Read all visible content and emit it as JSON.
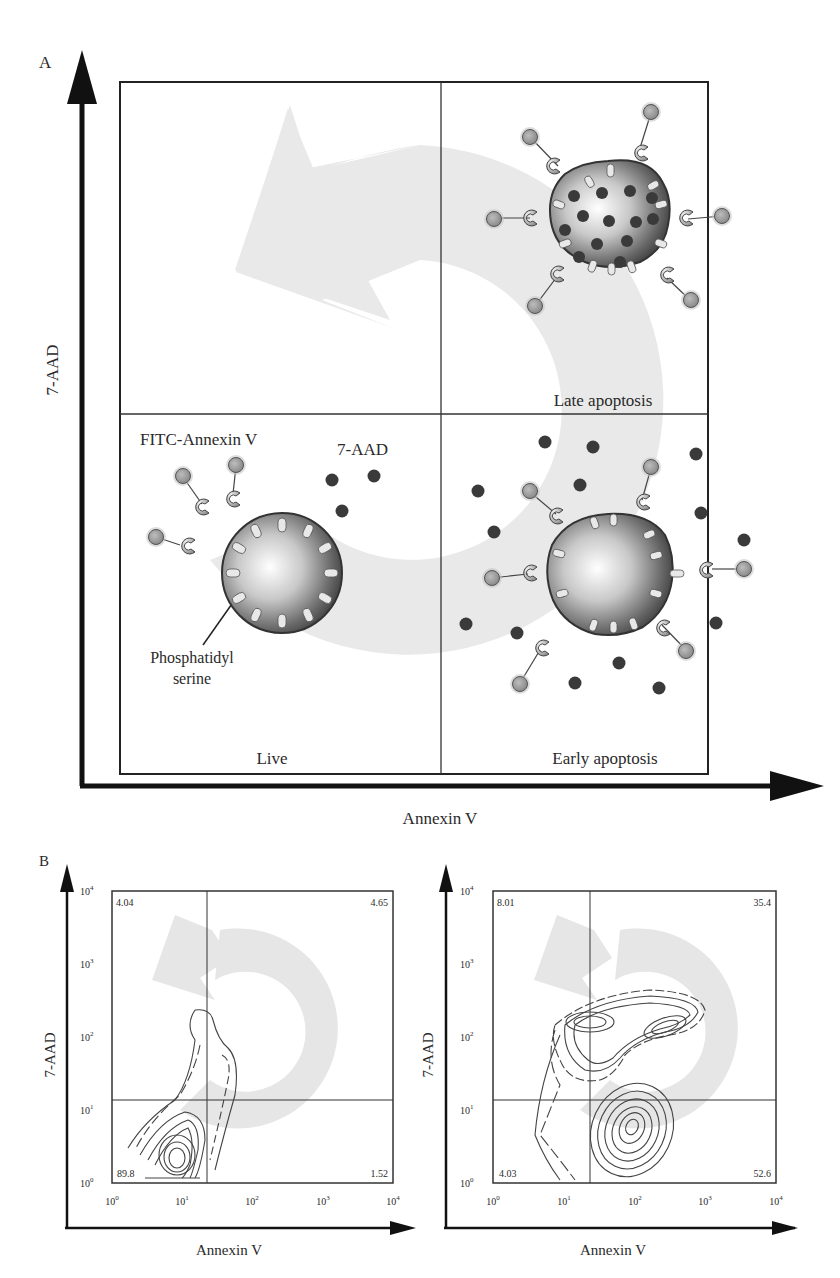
{
  "panel_a": {
    "label": "A",
    "y_axis_label": "7-AAD",
    "x_axis_label": "Annexin V",
    "quadrants": {
      "upper_left": "",
      "upper_right": "Late apoptosis",
      "lower_left": "Live",
      "lower_right": "Early apoptosis"
    },
    "annotations": {
      "fitc_annexin": "FITC-Annexin V",
      "seven_aad": "7-AAD",
      "ps_line1": "Phosphatidyl",
      "ps_line2": "serine"
    }
  },
  "panel_b": {
    "label": "B",
    "plots": [
      {
        "y_axis_label": "7-AAD",
        "x_axis_label": "Annexin V",
        "quadrant_values": {
          "upper_left": "4.04",
          "upper_right": "4.65",
          "lower_left": "89.8",
          "lower_right": "1.52"
        }
      },
      {
        "y_axis_label": "7-AAD",
        "x_axis_label": "Annexin V",
        "quadrant_values": {
          "upper_left": "8.01",
          "upper_right": "35.4",
          "lower_left": "4.03",
          "lower_right": "52.6"
        }
      }
    ],
    "tick_labels": [
      "10⁰",
      "10¹",
      "10²",
      "10³",
      "10⁴"
    ]
  },
  "colors": {
    "axis": "#111111",
    "arrow_band": "#e6e6e6",
    "dot": "#3a3a3a",
    "probe": "#9a9a9a"
  }
}
